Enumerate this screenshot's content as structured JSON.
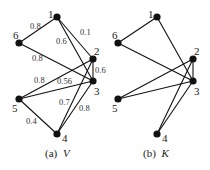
{
  "figure": {
    "nodes": [
      {
        "id": "1",
        "label": "1"
      },
      {
        "id": "2",
        "label": "2"
      },
      {
        "id": "3",
        "label": "3"
      },
      {
        "id": "4",
        "label": "4"
      },
      {
        "id": "5",
        "label": "5"
      },
      {
        "id": "6",
        "label": "6"
      }
    ],
    "graph_v": {
      "caption_prefix": "(a)",
      "caption_var": "V",
      "edges": [
        {
          "from": "1",
          "to": "6",
          "weight": "0.8"
        },
        {
          "from": "1",
          "to": "2",
          "weight": "0.1"
        },
        {
          "from": "1",
          "to": "3",
          "weight": "0.6"
        },
        {
          "from": "6",
          "to": "3",
          "weight": "0.8"
        },
        {
          "from": "2",
          "to": "3",
          "weight": "0.6"
        },
        {
          "from": "5",
          "to": "2",
          "weight": "0.8"
        },
        {
          "from": "5",
          "to": "3",
          "weight": "0.56"
        },
        {
          "from": "5",
          "to": "4",
          "weight": "0.4"
        },
        {
          "from": "4",
          "to": "2",
          "weight": "0.7"
        },
        {
          "from": "4",
          "to": "3",
          "weight": "0.8"
        }
      ]
    },
    "graph_k": {
      "caption_prefix": "(b)",
      "caption_var": "K",
      "edges": [
        {
          "from": "1",
          "to": "6"
        },
        {
          "from": "1",
          "to": "3"
        },
        {
          "from": "6",
          "to": "3"
        },
        {
          "from": "2",
          "to": "3"
        },
        {
          "from": "5",
          "to": "2"
        },
        {
          "from": "5",
          "to": "3"
        },
        {
          "from": "4",
          "to": "2"
        },
        {
          "from": "4",
          "to": "3"
        }
      ]
    }
  }
}
